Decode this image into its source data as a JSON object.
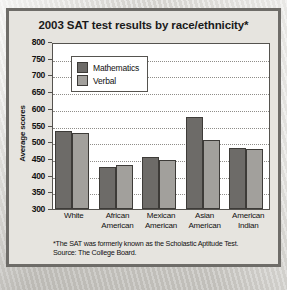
{
  "chart_data": {
    "type": "bar",
    "title": "2003 SAT test results by race/ethnicity*",
    "xlabel": "",
    "ylabel": "Average scores",
    "ylim": [
      300,
      800
    ],
    "ytick_step": 50,
    "yticks": [
      800,
      750,
      700,
      650,
      600,
      550,
      500,
      450,
      400,
      350,
      300
    ],
    "grid": true,
    "legend_position": "top-left-inside",
    "categories": [
      "White",
      "African American",
      "Mexican American",
      "Asian American",
      "American Indian"
    ],
    "category_lines": [
      [
        "White",
        ""
      ],
      [
        "African",
        "American"
      ],
      [
        "Mexican",
        "American"
      ],
      [
        "Asian",
        "American"
      ],
      [
        "American",
        "Indian"
      ]
    ],
    "series": [
      {
        "name": "Mathematics",
        "color": "#6d6b68",
        "values": [
          534,
          426,
          457,
          575,
          482
        ]
      },
      {
        "name": "Verbal",
        "color": "#a2a09c",
        "values": [
          529,
          431,
          448,
          508,
          480
        ]
      }
    ],
    "annotations": [
      "*The SAT was formerly known as the Scholastic Aptitude Test.",
      "Source: The College Board."
    ]
  },
  "footnote": {
    "line1": "*The SAT was formerly known as the Scholastic Aptitude Test.",
    "line2": "Source: The College Board."
  }
}
